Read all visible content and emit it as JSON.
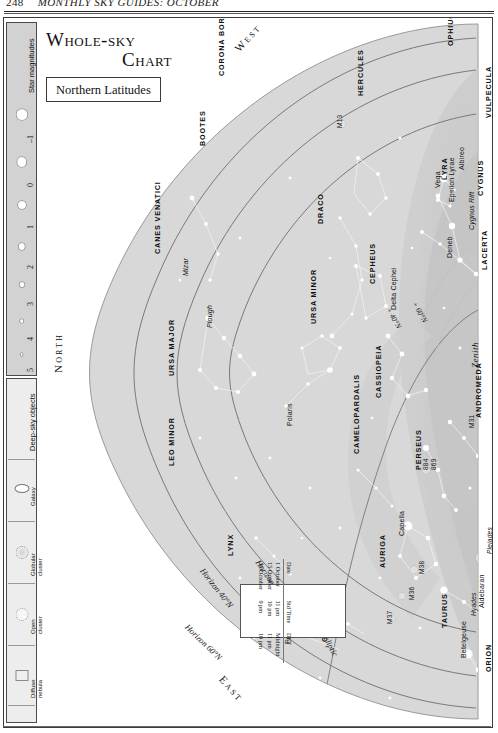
{
  "page_header": {
    "folio": "248",
    "running_title": "MONTHLY SKY GUIDES: OCTOBER"
  },
  "title_block": {
    "line1": "Whole-sky",
    "line2": "Chart",
    "subtitle": "Northern Latitudes"
  },
  "legend": {
    "magnitudes": {
      "title": "Star magnitudes",
      "values": [
        "–1",
        "0",
        "1",
        "2",
        "3",
        "4",
        "5"
      ]
    },
    "deep_sky": {
      "title": "Deep-sky objects",
      "items": [
        {
          "name": "Galaxy",
          "icon": "galaxy-icon"
        },
        {
          "name": "Globular\ncluster",
          "icon": "globular-cluster-icon"
        },
        {
          "name": "Open\ncluster",
          "icon": "open-cluster-icon"
        },
        {
          "name": "Diffuse\nnebula",
          "icon": "diffuse-nebula-icon"
        },
        {
          "name": "Planetary\nnebula",
          "icon": "planetary-nebula-icon"
        }
      ]
    }
  },
  "compass": {
    "north": "North",
    "west": "West",
    "east": "East",
    "zenith": "Zenith"
  },
  "curves": [
    {
      "label": "Horizon 60°N"
    },
    {
      "label": "Horizon 40°N"
    },
    {
      "label": "Horizon 20°N"
    },
    {
      "label": "Ecliptic"
    },
    {
      "label": "+ 60°N"
    },
    {
      "label": "+ 40°N"
    }
  ],
  "constellations": [
    "CORONA BOREALIS",
    "BOOTES",
    "HERCULES",
    "OPHIUCHUS",
    "VULPECULA",
    "CYGNUS",
    "LYRA",
    "LACERTA",
    "DRACO",
    "CEPHEUS",
    "URSA MINOR",
    "CASSIOPEIA",
    "ANDROMEDA",
    "CAMELOPARDALIS",
    "PERSEUS",
    "CANES VENATICI",
    "URSA MAJOR",
    "LEO MINOR",
    "LYNX",
    "AURIGA",
    "GEMINI",
    "TAURUS",
    "ORION"
  ],
  "stars": [
    "Vega",
    "Albireo",
    "Deneb",
    "Epsilon Lyrae",
    "Mizar",
    "Polaris",
    "Capella",
    "Castor",
    "Pollux",
    "Aldebaran",
    "Betelgeuse",
    "Delta Cephei",
    "Plough",
    "Cygnus Rift"
  ],
  "deep_sky_labels": [
    "M13",
    "M31",
    "M36",
    "M37",
    "M38",
    "869",
    "884",
    "Hyades",
    "Pleiades"
  ],
  "time_table": {
    "headers": [
      "Date",
      "Std Time",
      "DST"
    ],
    "rows": [
      [
        "1 October",
        "11 pm",
        "Midnight"
      ],
      [
        "15 October",
        "10 pm",
        "11 pm"
      ],
      [
        "30 October",
        "9 pm",
        "10 pm"
      ]
    ]
  },
  "colors": {
    "sky_fill": "#d9d9d9",
    "milky_way": "#c6c6c6",
    "star": "#ffffff",
    "line": "#efefef",
    "ink": "#111111"
  }
}
